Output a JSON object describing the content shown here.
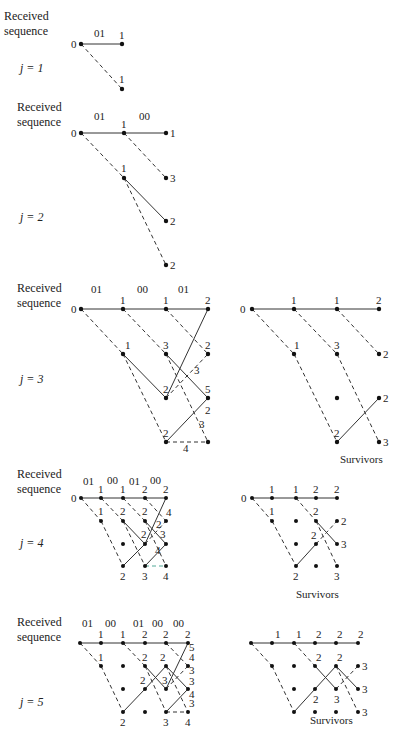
{
  "figure": {
    "side_label_line1": "Received",
    "side_label_line2": "sequence",
    "survivors_label": "Survivors"
  },
  "stages": [
    {
      "j_label": "j = 1",
      "received": [
        "01"
      ],
      "node_metrics": {
        "top": [
          "0",
          "1"
        ],
        "lower": [
          "1"
        ]
      }
    },
    {
      "j_label": "j = 2",
      "received": [
        "01",
        "00"
      ],
      "node_metrics": {
        "path_metrics": [
          "0",
          "1",
          "1",
          "1",
          "3",
          "2",
          "2"
        ]
      }
    },
    {
      "j_label": "j = 3",
      "received": [
        "01",
        "00",
        "01"
      ],
      "left_metrics": [
        "0",
        "1",
        "1",
        "2",
        "1",
        "3",
        "2",
        "3",
        "2",
        "5",
        "2",
        "3",
        "2",
        "4"
      ],
      "right_metrics": [
        "0",
        "1",
        "1",
        "2",
        "1",
        "3",
        "2",
        "2",
        "2",
        "3"
      ]
    },
    {
      "j_label": "j = 4",
      "received": [
        "01",
        "00",
        "01",
        "00"
      ],
      "left_metrics": [
        "0",
        "1",
        "1",
        "2",
        "2",
        "1",
        "2",
        "2",
        "4",
        "2",
        "3",
        "2",
        "4",
        "2",
        "3",
        "4"
      ],
      "right_metrics": [
        "0",
        "1",
        "1",
        "2",
        "2",
        "1",
        "2",
        "2",
        "2",
        "3",
        "2",
        "3"
      ]
    },
    {
      "j_label": "j = 5",
      "received": [
        "01",
        "00",
        "01",
        "00",
        "00"
      ],
      "left_metrics": [
        "1",
        "1",
        "2",
        "2",
        "2",
        "1",
        "2",
        "2",
        "5",
        "4",
        "3",
        "2",
        "3",
        "3",
        "3",
        "4",
        "3",
        "2",
        "3",
        "4"
      ],
      "right_metrics": [
        "1",
        "1",
        "2",
        "2",
        "2",
        "2",
        "2",
        "3",
        "2",
        "3",
        "3",
        "3"
      ]
    }
  ]
}
